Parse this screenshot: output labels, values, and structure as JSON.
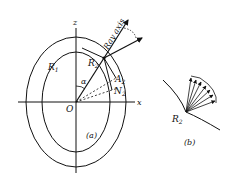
{
  "figure_a": {
    "caption": "(a)",
    "axis_z_label": "z",
    "axis_x_label": "x",
    "origin_label": "O",
    "angle_label": "α",
    "point_r1_label": "R",
    "point_r1_sub": "1",
    "point_r2_label": "R",
    "point_r2_sub": "2",
    "point_a2_label": "A",
    "point_a2_sub": "2",
    "point_n2_label": "N",
    "point_n2_sub": "2",
    "ray_axis_label": "Ray axis"
  },
  "figure_b": {
    "caption": "(b)",
    "point_label": "R",
    "point_sub": "2"
  },
  "colors": {
    "ink": "#111111",
    "background": "#ffffff"
  }
}
